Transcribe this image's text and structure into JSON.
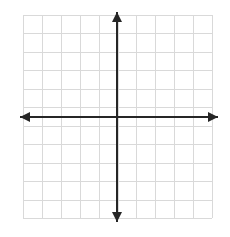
{
  "figure": {
    "name": "blank-coordinate-plane",
    "width": 230,
    "height": 237,
    "background_color": "#ffffff"
  },
  "chart_data": {
    "type": "scatter",
    "title": "",
    "subtitle": "",
    "xlabel": "",
    "ylabel": "",
    "series": [
      {
        "name": "",
        "x": [],
        "y": []
      }
    ],
    "x": [],
    "values": [],
    "categories": [],
    "xlim": [
      -5,
      5
    ],
    "ylim": [
      -5.5,
      5.5
    ],
    "xticks": [
      -5,
      -4,
      -3,
      -2,
      -1,
      0,
      1,
      2,
      3,
      4,
      5
    ],
    "yticks": [
      -5,
      -4,
      -3,
      -2,
      -1,
      0,
      1,
      2,
      3,
      4,
      5
    ],
    "xtick_labels": [],
    "ytick_labels": [],
    "grid": true,
    "grid_columns": 10,
    "grid_rows": 11,
    "legend": [],
    "legend_position": "none",
    "annotations": [],
    "axes": {
      "x_axis_arrows": "both",
      "y_axis_arrows": "both",
      "origin_shown": true
    }
  },
  "geometry": {
    "grid_left": 23,
    "grid_right": 212,
    "grid_top": 15,
    "grid_bottom": 218,
    "grid_cols": 10,
    "grid_rows": 11,
    "origin_x": 117,
    "origin_y": 117,
    "x_axis_start": 20,
    "x_axis_end": 218,
    "y_axis_start": 12,
    "y_axis_end": 222,
    "axis_stroke_width": 2,
    "grid_stroke_width": 1,
    "arrow_half_width": 5,
    "arrow_length": 10
  },
  "colors": {
    "grid": "#d9d9d9",
    "axis": "#262626",
    "arrow": "#262626",
    "background": "#ffffff"
  }
}
